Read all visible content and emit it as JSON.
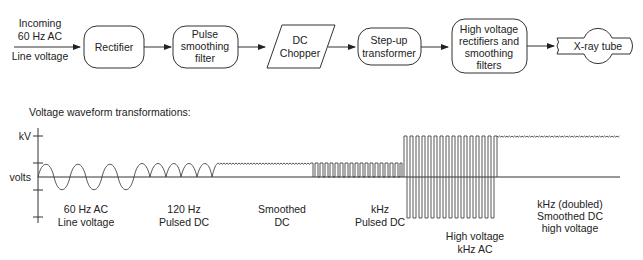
{
  "flow": {
    "input": {
      "line1": "Incoming",
      "line2": "60 Hz AC",
      "line3": "Line voltage"
    },
    "nodes": [
      {
        "id": "rectifier",
        "shape": "rounded-rect",
        "lines": [
          "Rectifier"
        ]
      },
      {
        "id": "pulse-smoothing-filter",
        "shape": "rounded-rect",
        "lines": [
          "Pulse",
          "smoothing",
          "filter"
        ]
      },
      {
        "id": "dc-chopper",
        "shape": "parallelogram",
        "lines": [
          "DC",
          "Chopper"
        ]
      },
      {
        "id": "step-up-transformer",
        "shape": "rounded-rect",
        "lines": [
          "Step-up",
          "transformer"
        ]
      },
      {
        "id": "hv-rectifiers-filters",
        "shape": "rounded-rect",
        "lines": [
          "High voltage",
          "rectifiers and",
          "smoothing",
          "filters"
        ]
      },
      {
        "id": "xray-tube",
        "shape": "tube",
        "lines": [
          "X-ray tube"
        ]
      }
    ]
  },
  "waveforms": {
    "title": "Voltage waveform transformations:",
    "axis": {
      "top_label": "kV",
      "mid_label": "volts"
    },
    "stages": [
      {
        "id": "ac-line",
        "label1": "60 Hz AC",
        "label2": "Line voltage",
        "label3": ""
      },
      {
        "id": "pulsed-dc",
        "label1": "120 Hz",
        "label2": "Pulsed DC",
        "label3": ""
      },
      {
        "id": "smoothed-dc",
        "label1": "Smoothed",
        "label2": "DC",
        "label3": ""
      },
      {
        "id": "khz-pulsed-dc",
        "label1": "kHz",
        "label2": "Pulsed DC",
        "label3": ""
      },
      {
        "id": "hv-khz-ac",
        "label1": "High voltage",
        "label2": "kHz AC",
        "label3": ""
      },
      {
        "id": "hv-smoothed-dc",
        "label1": "kHz (doubled)",
        "label2": "Smoothed DC",
        "label3": "high voltage"
      }
    ]
  }
}
